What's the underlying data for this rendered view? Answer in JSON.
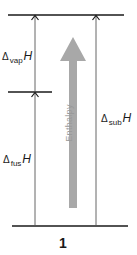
{
  "diagram": {
    "type": "energy-level-diagram",
    "levels": [
      {
        "name": "top",
        "label": ""
      },
      {
        "name": "middle",
        "label": ""
      },
      {
        "name": "bottom",
        "label": ""
      }
    ],
    "arrows": [
      {
        "name": "vaporization",
        "label_symbol": "Δ",
        "label_sub": "vap",
        "label_var": "H"
      },
      {
        "name": "fusion",
        "label_symbol": "Δ",
        "label_sub": "fus",
        "label_var": "H"
      },
      {
        "name": "sublimation",
        "label_symbol": "Δ",
        "label_sub": "sub",
        "label_var": "H"
      }
    ],
    "axis_label": "Enthalpy",
    "figure_number": "1",
    "colors": {
      "lines": "#1a1a1a",
      "thin_arrows": "#555555",
      "enthalpy_arrow": "#a8a8a8",
      "enthalpy_text": "#9a9a9a"
    }
  }
}
